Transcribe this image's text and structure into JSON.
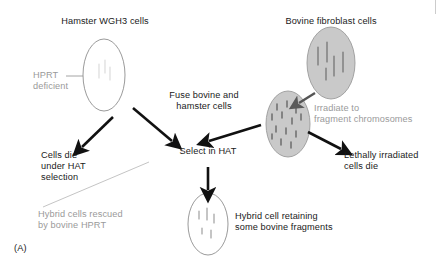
{
  "figure": {
    "panel_label": "(A)",
    "type": "biology-process-diagram",
    "background_color": "#ffffff",
    "text_color": "#1a1a1a",
    "muted_text_color": "#9a9a9a",
    "cell_fill_gray": "#c9c9c9",
    "cell_fill_white": "#ffffff",
    "cell_stroke": "#8c8c8c"
  },
  "labels": {
    "hamster_title": "Hamster WGH3 cells",
    "hprt_deficient_line1": "HPRT",
    "hprt_deficient_line2": "deficient",
    "bovine_title": "Bovine fibroblast cells",
    "fuse_line1": "Fuse bovine and",
    "fuse_line2": "hamster cells",
    "irradiate_line1": "Irradiate to",
    "irradiate_line2": "fragment chromosomes",
    "cells_die_line1": "Cells die",
    "cells_die_line2": "under HAT",
    "cells_die_line3": "selection",
    "select_in_hat": "Select in HAT",
    "lethally_line1": "Lethally irradiated",
    "lethally_line2": "cells die",
    "hybrid_rescued_line1": "Hybrid cells rescued",
    "hybrid_rescued_line2": "by bovine HPRT",
    "hybrid_cell_line1": "Hybrid cell retaining",
    "hybrid_cell_line2": "some bovine fragments"
  },
  "cells": [
    {
      "name": "hamster-wgh3-cell",
      "fill": "white",
      "contents": "faint-internal-marks",
      "cx": 104,
      "cy": 75,
      "rx": 21,
      "ry": 36
    },
    {
      "name": "bovine-fibroblast-cell",
      "fill": "gray",
      "contents": "intact-chromosomes",
      "cx": 331,
      "cy": 63,
      "rx": 24,
      "ry": 36
    },
    {
      "name": "irradiated-bovine-cell",
      "fill": "gray",
      "contents": "fragmented-chromosomes",
      "cx": 288,
      "cy": 124,
      "rx": 22,
      "ry": 33
    },
    {
      "name": "hybrid-cell",
      "fill": "white",
      "contents": "few-bovine-fragments",
      "cx": 208,
      "cy": 224,
      "rx": 20,
      "ry": 31
    }
  ],
  "arrows": [
    {
      "name": "arrow-hamster-to-cells-die",
      "from": [
        112,
        117
      ],
      "to": [
        80,
        148
      ]
    },
    {
      "name": "arrow-hamster-to-fuse",
      "from": [
        135,
        110
      ],
      "to": [
        172,
        142
      ]
    },
    {
      "name": "arrow-irradiated-to-fuse",
      "from": [
        258,
        126
      ],
      "to": [
        208,
        142
      ]
    },
    {
      "name": "arrow-bovine-to-irradiated",
      "from": [
        312,
        95
      ],
      "to": [
        297,
        104
      ]
    },
    {
      "name": "arrow-irradiated-to-lethal",
      "from": [
        310,
        133
      ],
      "to": [
        340,
        148
      ]
    },
    {
      "name": "arrow-select-to-hybrid",
      "from": [
        208,
        168
      ],
      "to": [
        208,
        190
      ]
    }
  ],
  "leader_lines": [
    {
      "name": "leader-hprt-deficient",
      "from": [
        66,
        76
      ],
      "to": [
        112,
        76
      ],
      "color": "#9a9a9a"
    },
    {
      "name": "leader-hybrid-rescued",
      "from": [
        43,
        206
      ],
      "to": [
        148,
        163
      ],
      "color": "#b4b4b4"
    }
  ]
}
